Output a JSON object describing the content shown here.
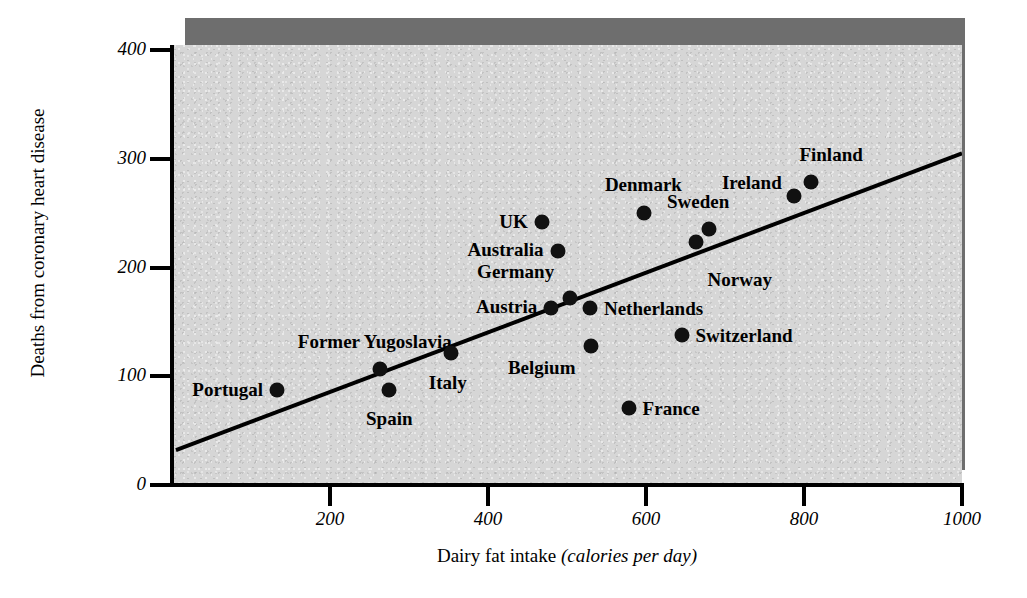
{
  "chart_data": {
    "type": "scatter",
    "title": "",
    "xlabel": "Dairy fat intake",
    "xlabel_units": "(calories per day)",
    "ylabel": "Deaths from coronary heart disease",
    "xlim": [
      0,
      1000
    ],
    "ylim": [
      0,
      400
    ],
    "xticks": [
      "200",
      "400",
      "600",
      "800",
      "1000"
    ],
    "xtick_values": [
      200,
      400,
      600,
      800,
      1000
    ],
    "yticks": [
      "0",
      "100",
      "200",
      "300",
      "400"
    ],
    "ytick_values": [
      0,
      100,
      200,
      300,
      400
    ],
    "grid": false,
    "legend": "none",
    "points": [
      {
        "label": "Portugal",
        "x": 133,
        "y": 87,
        "label_side": "r",
        "label_dx": -14,
        "label_dy": 0
      },
      {
        "label": "Former Yugoslavia",
        "x": 263,
        "y": 107,
        "label_side": "c",
        "label_dx": -5,
        "label_dy": -27
      },
      {
        "label": "Spain",
        "x": 275,
        "y": 87,
        "label_side": "c",
        "label_dx": 0,
        "label_dy": 29
      },
      {
        "label": "Italy",
        "x": 353,
        "y": 121,
        "label_side": "c",
        "label_dx": -3,
        "label_dy": 30
      },
      {
        "label": "UK",
        "x": 468,
        "y": 242,
        "label_side": "r",
        "label_dx": -14,
        "label_dy": 0
      },
      {
        "label": "Australia",
        "x": 488,
        "y": 215,
        "label_side": "r",
        "label_dx": -14,
        "label_dy": -1
      },
      {
        "label": "Austria",
        "x": 480,
        "y": 163,
        "label_side": "r",
        "label_dx": -14,
        "label_dy": -1
      },
      {
        "label": "Germany",
        "x": 504,
        "y": 172,
        "label_side": "r",
        "label_dx": -16,
        "label_dy": -26
      },
      {
        "label": "Netherlands",
        "x": 529,
        "y": 163,
        "label_side": "l",
        "label_dx": 14,
        "label_dy": 1
      },
      {
        "label": "Belgium",
        "x": 531,
        "y": 128,
        "label_side": "r",
        "label_dx": -16,
        "label_dy": 22
      },
      {
        "label": "Denmark",
        "x": 598,
        "y": 250,
        "label_side": "c",
        "label_dx": -1,
        "label_dy": -28
      },
      {
        "label": "Switzerland",
        "x": 645,
        "y": 138,
        "label_side": "l",
        "label_dx": 14,
        "label_dy": 1
      },
      {
        "label": "Norway",
        "x": 663,
        "y": 223,
        "label_side": "c",
        "label_dx": 44,
        "label_dy": 38
      },
      {
        "label": "Sweden",
        "x": 680,
        "y": 235,
        "label_side": "c",
        "label_dx": -11,
        "label_dy": -27
      },
      {
        "label": "Ireland",
        "x": 787,
        "y": 266,
        "label_side": "r",
        "label_dx": -12,
        "label_dy": -13
      },
      {
        "label": "Finland",
        "x": 809,
        "y": 279,
        "label_side": "c",
        "label_dx": 20,
        "label_dy": -27
      },
      {
        "label": "France",
        "x": 578,
        "y": 71,
        "label_side": "l",
        "label_dx": 14,
        "label_dy": 1
      }
    ],
    "trendline": {
      "x0": 5,
      "y0": 32,
      "x1": 1000,
      "y1": 305
    },
    "colors": {
      "panel_background": "#d6d6d6",
      "panel_shadow": "#6e6e6e",
      "axis": "#000000",
      "marker": "#111111",
      "trendline": "#000000",
      "text": "#000000",
      "page_background": "#ffffff"
    }
  }
}
